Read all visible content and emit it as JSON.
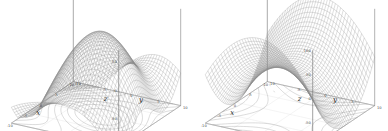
{
  "figure": {
    "background_color": "#ffffff",
    "mesh_color": "#8a8a8a",
    "axis_color": "#555555",
    "contour_color": "#9a9a9a",
    "panel_count": 2
  },
  "chart_data": [
    {
      "type": "surface",
      "title": "",
      "subtitle": "",
      "xlabel": "x",
      "ylabel": "y",
      "zlabel": "z",
      "xlim": [
        -10,
        10
      ],
      "ylim": [
        -10,
        10
      ],
      "zlim": [
        -100,
        70
      ],
      "xticks": [
        -10,
        -5,
        0,
        5,
        10
      ],
      "xticklabels": [
        "-10",
        "-5",
        "0",
        "5",
        "10"
      ],
      "yticks": [
        -10,
        -5,
        0,
        5,
        10
      ],
      "yticklabels": [
        "-10",
        "-5",
        "0",
        "5",
        "10"
      ],
      "zticks": [
        -100,
        -50,
        0,
        50
      ],
      "zticklabels": [
        "-100",
        "-50",
        "0",
        "50"
      ],
      "grid": false,
      "legend": "none",
      "projection": "3d",
      "wireframe": true,
      "mesh_rows": 40,
      "mesh_cols": 40,
      "base_contours": true,
      "surface_description": "wavy saddle-like wireframe surface with a ridge rising at left-rear and a dip at right, contour projection drawn on the floor plane",
      "sample_points": {
        "x": [
          -10,
          -5,
          0,
          5,
          10
        ],
        "y": [
          -10,
          -5,
          0,
          5,
          10
        ],
        "z_grid": [
          [
            -20,
            10,
            40,
            30,
            0
          ],
          [
            5,
            45,
            65,
            45,
            10
          ],
          [
            20,
            60,
            55,
            20,
            -20
          ],
          [
            0,
            30,
            15,
            -30,
            -70
          ],
          [
            -40,
            -20,
            -40,
            -80,
            -100
          ]
        ]
      }
    },
    {
      "type": "surface",
      "title": "",
      "subtitle": "",
      "xlabel": "x",
      "ylabel": "y",
      "zlabel": "z",
      "xlim": [
        -10,
        10
      ],
      "ylim": [
        -10,
        10
      ],
      "zlim": [
        -100,
        100
      ],
      "xticks": [
        -10,
        -5,
        0,
        5,
        10
      ],
      "xticklabels": [
        "-10",
        "-5",
        "0",
        "5",
        "10"
      ],
      "yticks": [
        -10,
        -5,
        0,
        5,
        10
      ],
      "yticklabels": [
        "-10",
        "-5",
        "0",
        "5",
        "10"
      ],
      "zticks": [
        -100,
        -50,
        0,
        50,
        100
      ],
      "zticklabels": [
        "-100",
        "-50",
        "0",
        "50",
        "100"
      ],
      "grid": false,
      "legend": "none",
      "projection": "3d",
      "wireframe": true,
      "mesh_rows": 40,
      "mesh_cols": 40,
      "base_contours": true,
      "surface_description": "hyperbolic paraboloid (saddle) wireframe rising at the two far corners and dipping toward the centre, hyperbolic contour projection on the floor plane",
      "sample_points": {
        "x": [
          -10,
          -5,
          0,
          5,
          10
        ],
        "y": [
          -10,
          -5,
          0,
          5,
          10
        ],
        "z_grid": [
          [
            100,
            40,
            0,
            40,
            100
          ],
          [
            40,
            10,
            -25,
            10,
            40
          ],
          [
            0,
            -25,
            -60,
            -25,
            0
          ],
          [
            40,
            10,
            -25,
            10,
            40
          ],
          [
            100,
            40,
            0,
            40,
            100
          ]
        ]
      }
    }
  ]
}
